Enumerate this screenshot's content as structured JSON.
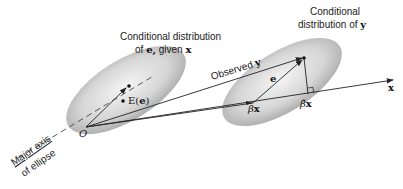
{
  "diagram": {
    "left_ellipse": {
      "title_line1": "Conditional distribution",
      "title_line2_prefix": "of ",
      "title_line2_e": "e,",
      "title_line2_mid": " given ",
      "title_line2_x": "x",
      "origin_label": "O",
      "expectation_label_prefix": "E(",
      "expectation_label_e": "e",
      "expectation_label_suffix": ")"
    },
    "right_ellipse": {
      "title_line1": "Conditional",
      "title_line2_prefix": "distribution of ",
      "title_line2_y": "y",
      "error_label": "e",
      "beta_x_label_beta": "β",
      "beta_x_label_x": "x",
      "beta_hat_x_label_beta": "β̂",
      "beta_hat_x_label_x": "x"
    },
    "observed_label_prefix": "Observed ",
    "observed_label_y": "y",
    "x_axis_label": "x",
    "major_axis_line1": "Major axis",
    "major_axis_line2": "of ellipse",
    "colors": {
      "ellipse_fill_center": "#f2f2f2",
      "ellipse_fill_edge": "#a8a8a8",
      "line": "#222222"
    }
  }
}
